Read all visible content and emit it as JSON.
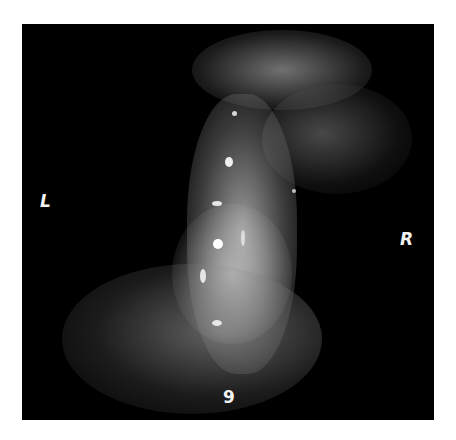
{
  "image": {
    "description": "Grayscale radiographic / fluoroscopic image on black background",
    "labels": {
      "left": "L",
      "right": "R",
      "bottom": "9"
    },
    "colors": {
      "background": "#000000",
      "page": "#ffffff",
      "label": "#f2f2f2"
    }
  }
}
